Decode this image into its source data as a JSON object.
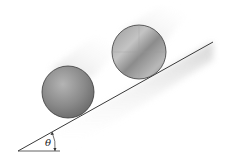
{
  "diagram": {
    "incline": {
      "angle_label": "θ",
      "line_color": "#3a3a3a"
    },
    "objects": [
      {
        "name": "sphere",
        "label": "",
        "fill": "#8e8e8e",
        "edge": "#3a3a3a"
      },
      {
        "name": "cylinder",
        "label": "",
        "fill": "#a8a8a8",
        "edge": "#3a3a3a"
      }
    ]
  }
}
